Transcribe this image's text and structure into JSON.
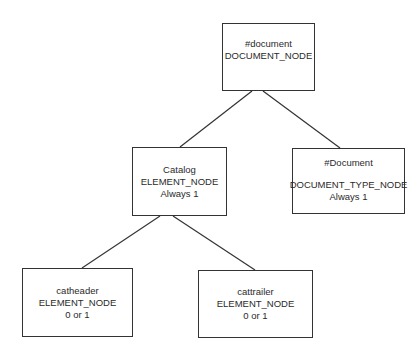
{
  "diagram": {
    "type": "tree",
    "nodes": [
      {
        "id": "document",
        "name": "#document",
        "type": "DOCUMENT_NODE",
        "cardinality": ""
      },
      {
        "id": "catalog",
        "name": "Catalog",
        "type": "ELEMENT_NODE",
        "cardinality": "Always 1"
      },
      {
        "id": "doctype",
        "name": "#Document",
        "type": "DOCUMENT_TYPE_NODE",
        "cardinality": "Always 1"
      },
      {
        "id": "catheader",
        "name": "catheader",
        "type": "ELEMENT_NODE",
        "cardinality": "0 or 1"
      },
      {
        "id": "cattrailer",
        "name": "cattrailer",
        "type": "ELEMENT_NODE",
        "cardinality": "0 or 1"
      }
    ],
    "edges": [
      {
        "from": "document",
        "to": "catalog"
      },
      {
        "from": "document",
        "to": "doctype"
      },
      {
        "from": "catalog",
        "to": "catheader"
      },
      {
        "from": "catalog",
        "to": "cattrailer"
      }
    ],
    "colors": {
      "stroke": "#333333",
      "text": "#2a2a2a",
      "background": "#ffffff"
    }
  }
}
